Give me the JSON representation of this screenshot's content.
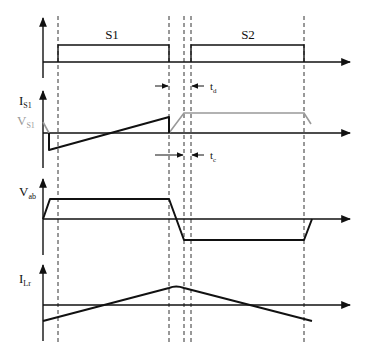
{
  "diagram": {
    "type": "timing-waveform",
    "panels": [
      {
        "id": "gate",
        "labels": [
          "S1",
          "S2"
        ]
      },
      {
        "id": "switch",
        "label_main": "I",
        "label_main_sub": "S1",
        "label_secondary": "V",
        "label_secondary_sub": "S1"
      },
      {
        "id": "vab",
        "label_main": "V",
        "label_main_sub": "ab"
      },
      {
        "id": "ilr",
        "label_main": "I",
        "label_main_sub": "Lr"
      }
    ],
    "annotations": {
      "td": {
        "main": "t",
        "sub": "d"
      },
      "tc": {
        "main": "t",
        "sub": "c"
      }
    },
    "colors": {
      "primary": "#111111",
      "secondary": "#999999",
      "dash": "#333333"
    }
  }
}
